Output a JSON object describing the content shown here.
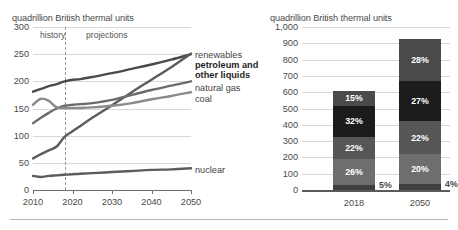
{
  "figure": {
    "background": "#ffffff",
    "foot_rule": true
  },
  "chart_data": [
    {
      "id": "energy-consumption-by-source",
      "type": "line",
      "title": "",
      "ylabel": "quadrillion British thermal units",
      "xlabel": "",
      "ylim": [
        0,
        300
      ],
      "xlim": [
        2010,
        2050
      ],
      "yticks": [
        "0",
        "50",
        "100",
        "150",
        "200",
        "250",
        "300"
      ],
      "ytick_values": [
        0,
        50,
        100,
        150,
        200,
        250,
        300
      ],
      "xticks": [
        "2010",
        "2020",
        "2030",
        "2040",
        "2050"
      ],
      "xtick_values": [
        2010,
        2020,
        2030,
        2040,
        2050
      ],
      "grid": true,
      "legend_position": "right-inline",
      "annotations": [
        {
          "name": "history",
          "text": "history",
          "x": 2013.5
        },
        {
          "name": "projections",
          "text": "projections",
          "x": 2024.5
        }
      ],
      "divider": {
        "name": "history-projection-divider",
        "x": 2018,
        "style": "dashed"
      },
      "x": [
        2010,
        2012,
        2014,
        2016,
        2018,
        2020,
        2022,
        2025,
        2030,
        2035,
        2040,
        2045,
        2050
      ],
      "series": [
        {
          "name": "petroleum and other liquids",
          "label": "petroleum and other liquids",
          "bold": true,
          "color": "#4a4a4a",
          "values": [
            181,
            186,
            191,
            195,
            200,
            203,
            204,
            208,
            215,
            223,
            231,
            240,
            250
          ]
        },
        {
          "name": "renewables",
          "label": "renewables",
          "bold": false,
          "color": "#5c5c5c",
          "values": [
            58,
            66,
            73,
            80,
            98,
            108,
            118,
            133,
            156,
            180,
            203,
            226,
            251
          ]
        },
        {
          "name": "natural gas",
          "label": "natural gas",
          "bold": false,
          "color": "#6b6b6b",
          "values": [
            123,
            133,
            142,
            150,
            155,
            157,
            158,
            160,
            166,
            175,
            184,
            192,
            200
          ]
        },
        {
          "name": "coal",
          "label": "coal",
          "bold": false,
          "color": "#8a8a8a",
          "values": [
            157,
            168,
            164,
            152,
            151,
            151,
            151,
            152,
            155,
            160,
            167,
            173,
            180
          ]
        },
        {
          "name": "nuclear",
          "label": "nuclear",
          "bold": false,
          "color": "#5c5c5c",
          "values": [
            26,
            24,
            26,
            27,
            28,
            29,
            30,
            31,
            33,
            35,
            37,
            38,
            40
          ]
        }
      ]
    },
    {
      "id": "energy-consumption-shares",
      "type": "bar",
      "stacked": true,
      "title": "",
      "ylabel": "quadrillion British thermal units",
      "xlabel": "",
      "ylim": [
        0,
        1000
      ],
      "yticks": [
        "0",
        "100",
        "200",
        "300",
        "400",
        "500",
        "600",
        "700",
        "800",
        "900",
        "1,000"
      ],
      "ytick_values": [
        0,
        100,
        200,
        300,
        400,
        500,
        600,
        700,
        800,
        900,
        1000
      ],
      "categories": [
        "2018",
        "2050"
      ],
      "grid": true,
      "bars": [
        {
          "category": "2018",
          "total": 610,
          "segments": [
            {
              "name": "nuclear",
              "label": "5%",
              "value": 30,
              "color": "#3f3f3f",
              "label_position": "outside-right"
            },
            {
              "name": "coal",
              "label": "26%",
              "value": 159,
              "color": "#6e6e6e",
              "label_position": "inside"
            },
            {
              "name": "natural-gas",
              "label": "22%",
              "value": 134,
              "color": "#565656",
              "label_position": "inside"
            },
            {
              "name": "petroleum-and-other-liquids",
              "label": "32%",
              "value": 195,
              "color": "#1c1c1c",
              "label_position": "inside"
            },
            {
              "name": "renewables",
              "label": "15%",
              "value": 92,
              "color": "#4a4a4a",
              "label_position": "inside"
            }
          ]
        },
        {
          "category": "2050",
          "total": 915,
          "segments": [
            {
              "name": "nuclear",
              "label": "4%",
              "value": 37,
              "color": "#3f3f3f",
              "label_position": "outside-right"
            },
            {
              "name": "coal",
              "label": "20%",
              "value": 183,
              "color": "#6e6e6e",
              "label_position": "inside"
            },
            {
              "name": "natural-gas",
              "label": "22%",
              "value": 201,
              "color": "#565656",
              "label_position": "inside"
            },
            {
              "name": "petroleum-and-other-liquids",
              "label": "27%",
              "value": 247,
              "color": "#1c1c1c",
              "label_position": "inside"
            },
            {
              "name": "renewables",
              "label": "28%",
              "value": 256,
              "color": "#4a4a4a",
              "label_position": "inside"
            }
          ]
        }
      ]
    }
  ]
}
